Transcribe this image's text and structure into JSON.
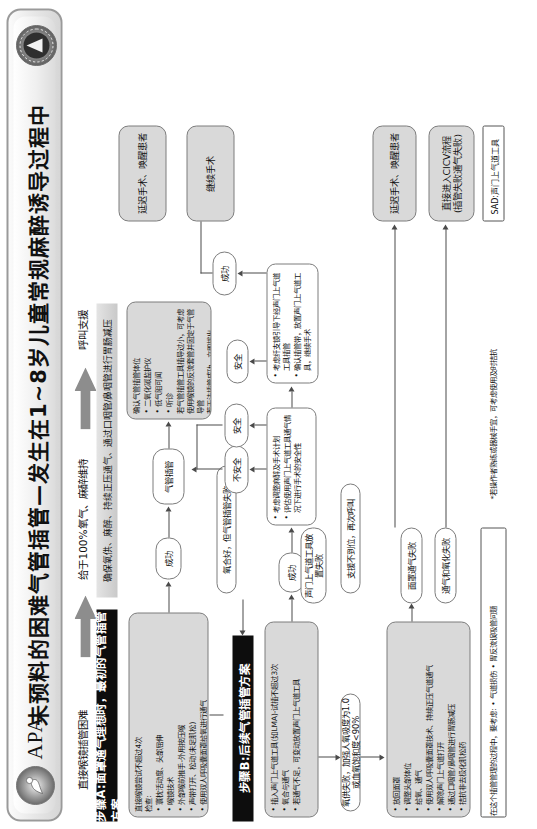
{
  "banner": {
    "org_abbrev": "APA",
    "title": "未预料的困难气管插管—发生在1~8岁儿童常规麻醉诱导过程中",
    "logo_left": "apa-crest-icon",
    "logo_right": "association-seal-icon"
  },
  "top_flow": {
    "label_1": "直接喉镜插管困难",
    "label_2": "给于100%氧气、麻醉维持",
    "label_3": "呼叫支援",
    "arrow_icon": "right-arrow-icon"
  },
  "section_a": {
    "header": "步骤A:面罩通气理想时，最初的气管插管方案",
    "sub_bar": "确保氧供、麻醉、持续正压通气、通过口咽管/鼻咽管进行胃肠减压",
    "box_checklist": {
      "lead": "直接喉镜尝试不超过4次\n检查:",
      "bullets": [
        "寰枕活动度、头部屈伸",
        "喉镜技术",
        "外部喉前推手-外用按压喉",
        "声带打开、松动(未足肌松)",
        "使用双人呼吸囊面罩给氧进行通气"
      ]
    },
    "success_label": "成功",
    "pill_intubated": "气管插管",
    "box_confirm": {
      "lead": "确认气管插管体位",
      "bullets": [
        "二氧化碳监护仪",
        "低气阻可闻",
        "听诊"
      ],
      "tail": "若气管插管工具插导过小，可考虑使用喉镜的反流套管并固定于气管导管\n若无法插管成功，立即拔出"
    }
  },
  "section_b": {
    "header": "步骤B:后续气管插管方案",
    "transition_pill": "氧合好，但气管插管失败",
    "box_sad": {
      "bullets": [
        "插入声门上气道工具(如LMA)-试插不超过3次",
        "氧合与通气",
        "若通气不足，可变动放置声门上气道工具"
      ]
    },
    "success_label": "成功",
    "box_plan": {
      "bullets": [
        "考虑调整麻醉及手术计划",
        "评估使用声门上气道工具通气情况下进行手术的安全性"
      ]
    },
    "branch_unsafe": "不安全",
    "branch_safe": "安全",
    "box_fiberoptic": {
      "bullets": [
        "考虑纤支镜引导下经声门上气道工具插管",
        "确认插管带，放置声门上气道工具，继续手术"
      ]
    },
    "safe_label": "安全",
    "success_label_2": "成功",
    "outcome_delay": "延迟手术、唤醒患者",
    "outcome_continue": "继续手术"
  },
  "section_c": {
    "pill_support": "支援不到位，再次呼叫",
    "pill_sad_fail": "声门上气道工具放置失败",
    "pill_mask_fail": "面罩通气失败",
    "pill_vent_fail": "通气和氧化失败",
    "pill_oxy_fail": "氧供失败，加强人氧吸度为1.0或血氧饱和度<90%",
    "box_rescue": {
      "bullets": [
        "放回面罩",
        "调整头部体位",
        "给氧、通气",
        "使用双人呼吸囊面罩技术、持续正压气道通气",
        "解除声门上气道打开",
        "通过口咽管/鼻咽管进行胃肠减压",
        "拮抗非去极化肌松药"
      ]
    },
    "outcome_delay": "延迟手术、唤醒患者",
    "outcome_cicv": "直接进入CICV流程\n(插管失败通气失败)"
  },
  "footnotes": {
    "note_star": "*若操作者熟练或器械手宜，可考虑使用及时拮抗",
    "note_process": "在这个插管管理的过程中，要考虑: • 气道损伤 • 胃反流误吸管问题",
    "legend": "SAD:声门上气道工具"
  },
  "colors": {
    "header_bar": "#0d0d0d",
    "box_fill": "#d9d9d9",
    "line": "#4a4a4a"
  }
}
